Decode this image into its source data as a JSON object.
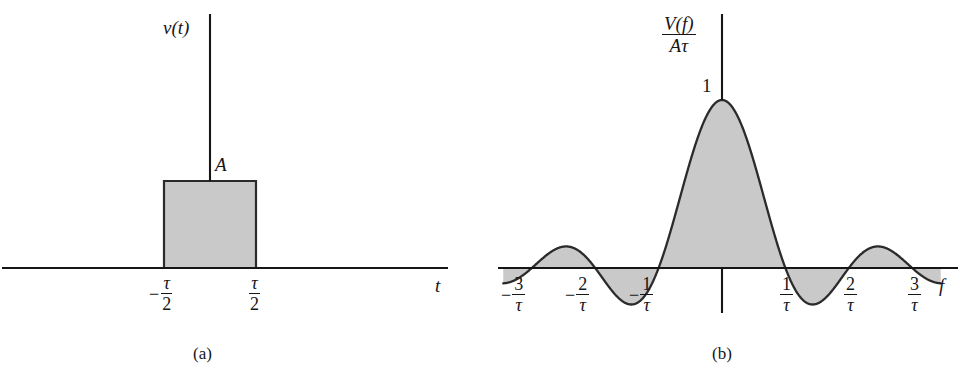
{
  "figure": {
    "background_color": "#ffffff",
    "line_color": "#161616",
    "fill_color": "#c9c9c9"
  },
  "panels": [
    {
      "id": "a",
      "caption": "(a)",
      "y_axis_label": "v(t)",
      "x_axis_label": "t",
      "amplitude_label": "A",
      "tick_labels": [
        {
          "sign": "−",
          "numerator": "τ",
          "denominator": "2",
          "x_value": -0.5
        },
        {
          "sign": "",
          "numerator": "τ",
          "denominator": "2",
          "x_value": 0.5
        }
      ],
      "chart_data": {
        "type": "area",
        "title": "Rectangular pulse v(t)",
        "xlabel": "t",
        "ylabel": "v(t)",
        "xlim": [
          -2.45,
          3.75
        ],
        "ylim": [
          0,
          1.55
        ],
        "grid": false,
        "legend": null,
        "x": [
          -2.45,
          -0.5,
          -0.5,
          0.5,
          0.5,
          3.75
        ],
        "values": [
          0,
          0,
          1,
          1,
          0,
          0
        ],
        "annotations": [
          {
            "text": "A",
            "x": 0.07,
            "y": 1.12,
            "note": "pulse amplitude"
          },
          {
            "text": "-τ/2",
            "x": -0.5,
            "y": 0,
            "note": "left pulse edge"
          },
          {
            "text": "τ/2",
            "x": 0.5,
            "y": 0,
            "note": "right pulse edge"
          }
        ]
      }
    },
    {
      "id": "b",
      "caption": "(b)",
      "y_axis_label_numerator": "V(f)",
      "y_axis_label_denominator": "Aτ",
      "x_axis_label": "f",
      "peak_label": "1",
      "tick_labels": [
        {
          "sign": "−",
          "numerator": "3",
          "denominator": "τ",
          "x_value": -3
        },
        {
          "sign": "−",
          "numerator": "2",
          "denominator": "τ",
          "x_value": -2
        },
        {
          "sign": "−",
          "numerator": "1",
          "denominator": "τ",
          "x_value": -1
        },
        {
          "sign": "",
          "numerator": "1",
          "denominator": "τ",
          "x_value": 1
        },
        {
          "sign": "",
          "numerator": "2",
          "denominator": "τ",
          "x_value": 2
        },
        {
          "sign": "",
          "numerator": "3",
          "denominator": "τ",
          "x_value": 3
        }
      ],
      "chart_data": {
        "type": "line",
        "title": "Spectrum V(f)/Aτ = sinc(fτ)",
        "xlabel": "f",
        "ylabel": "V(f)/Aτ",
        "xlim": [
          -3.45,
          3.45
        ],
        "ylim": [
          -0.23,
          1.12
        ],
        "grid": false,
        "legend": null,
        "function": "sinc(x) = sin(pi*x)/(pi*x)",
        "zero_crossings": [
          -3,
          -2,
          -1,
          1,
          2,
          3
        ],
        "key_points": [
          {
            "x": 0,
            "y": 1.0,
            "label": "1"
          },
          {
            "x": -1.43,
            "y": -0.217
          },
          {
            "x": 1.43,
            "y": -0.217
          },
          {
            "x": -2.46,
            "y": 0.128
          },
          {
            "x": 2.46,
            "y": 0.128
          },
          {
            "x": -3.47,
            "y": -0.091
          },
          {
            "x": 3.47,
            "y": -0.091
          }
        ],
        "annotations": [
          {
            "text": "1",
            "x": -0.12,
            "y": 1.0,
            "note": "peak value at f = 0"
          }
        ]
      }
    }
  ]
}
